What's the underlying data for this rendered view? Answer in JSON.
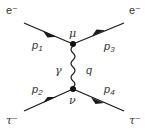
{
  "diagram": {
    "type": "feynman",
    "particles": {
      "in_top": "e⁻",
      "out_top": "e⁻",
      "in_bottom": "τ⁻",
      "out_bottom": "τ⁻"
    },
    "momenta": {
      "p1": {
        "base": "p",
        "sub": "1"
      },
      "p2": {
        "base": "p",
        "sub": "2"
      },
      "p3": {
        "base": "p",
        "sub": "3"
      },
      "p4": {
        "base": "p",
        "sub": "4"
      }
    },
    "vertices": {
      "top": "μ",
      "bottom": "ν"
    },
    "propagator": {
      "particle": "γ",
      "momentum": "q"
    },
    "colors": {
      "line": "#1a1a1a",
      "text": "#333333"
    }
  }
}
